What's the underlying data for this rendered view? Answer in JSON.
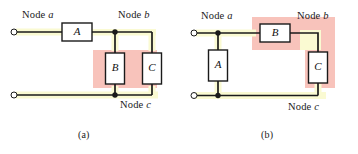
{
  "figure": {
    "background_color": "#ffffff",
    "wire_color": "#1a1a1a",
    "highlight_pink": "#f8c3bb",
    "highlight_yellow": "#fafad2",
    "box_fill": "#ffffff",
    "box_stroke": "#1a1a1a"
  },
  "panels": [
    {
      "id": "a",
      "caption": "(a)",
      "node_labels": {
        "node_a": "Node a",
        "node_b": "Node b",
        "node_c": "Node c"
      },
      "components": [
        {
          "id": "A",
          "label": "A",
          "orientation": "horizontal"
        },
        {
          "id": "B",
          "label": "B",
          "orientation": "vertical"
        },
        {
          "id": "C",
          "label": "C",
          "orientation": "vertical"
        }
      ],
      "highlight_shape": "rectangle",
      "highlighted_components": [
        "B",
        "C"
      ],
      "highlighted_nodes": [
        "node a terminal wire",
        "node c wire"
      ]
    },
    {
      "id": "b",
      "caption": "(b)",
      "node_labels": {
        "node_a": "Node a",
        "node_b": "Node b",
        "node_c": "Node c"
      },
      "components": [
        {
          "id": "A",
          "label": "A",
          "orientation": "vertical"
        },
        {
          "id": "B",
          "label": "B",
          "orientation": "horizontal"
        },
        {
          "id": "C",
          "label": "C",
          "orientation": "vertical"
        }
      ],
      "highlight_shape": "L-shape",
      "highlighted_components": [
        "B",
        "C"
      ],
      "highlighted_nodes": [
        "node a terminal wire",
        "node c wire"
      ]
    }
  ],
  "text_items": {
    "a_node_a": "Node a",
    "a_node_b": "Node b",
    "a_node_c": "Node c",
    "a_box_A": "A",
    "a_box_B": "B",
    "a_box_C": "C",
    "a_caption": "(a)",
    "b_node_a": "Node a",
    "b_node_b": "Node b",
    "b_node_c": "Node c",
    "b_box_A": "A",
    "b_box_B": "B",
    "b_box_C": "C",
    "b_caption": "(b)"
  }
}
